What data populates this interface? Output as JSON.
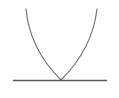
{
  "figure": {
    "background_color": "#ffffff",
    "width": 119,
    "height": 98
  },
  "colors": {
    "curve": "#6b6b6b",
    "line": "#5a5a5a",
    "background": "#ffffff"
  },
  "elements": {
    "parabola": {
      "name": "parabola-curve",
      "stroke_color": "#6b6b6b",
      "stroke_width": 1.1,
      "vertex": {
        "x": 61,
        "y": 80
      },
      "left_endpoint": {
        "x": 26,
        "y": 9
      },
      "right_endpoint": {
        "x": 97,
        "y": 9
      },
      "path": "M 26 9 Q 29.6 48.8 61 80 Q 92.4 48.8 97 9"
    },
    "tangent_line": {
      "name": "horizontal-tangent-line",
      "stroke_color": "#5a5a5a",
      "stroke_width": 1.6,
      "x_start": 13,
      "x_end": 107,
      "y": 80.5
    },
    "tangent_point": {
      "name": "tangency-point",
      "x": 61,
      "y": 80,
      "visible_marker": false
    }
  }
}
